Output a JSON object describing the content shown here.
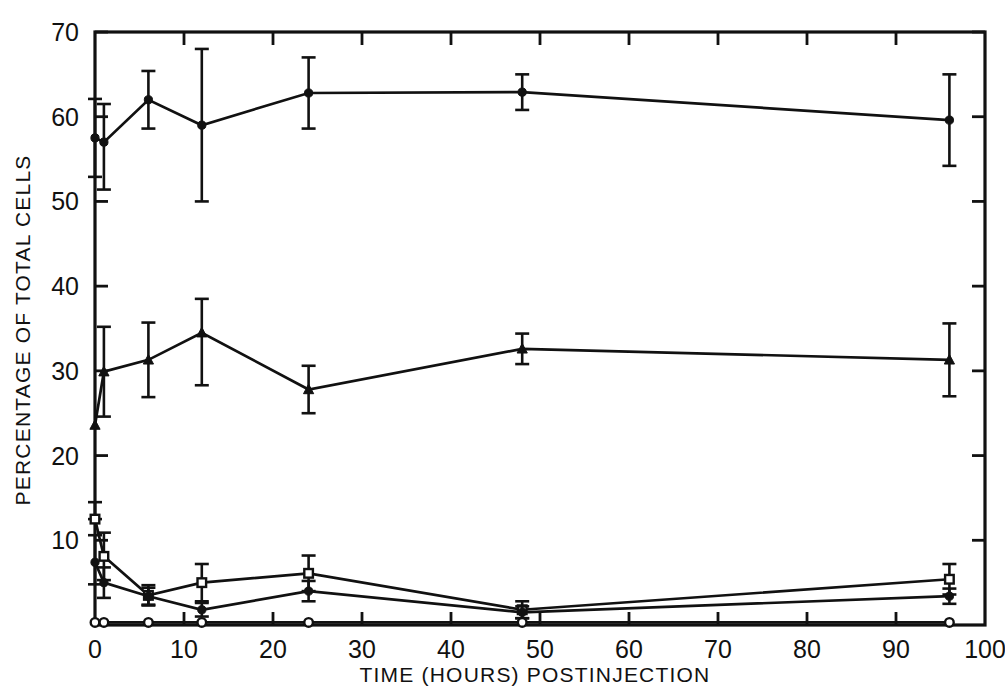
{
  "chart_data": {
    "type": "line",
    "title": "",
    "xlabel": "TIME (HOURS) POSTINJECTION",
    "ylabel": "PERCENTAGE OF TOTAL CELLS",
    "xlim": [
      0,
      100
    ],
    "ylim": [
      0,
      70
    ],
    "xticks": [
      0,
      10,
      20,
      30,
      40,
      50,
      60,
      70,
      80,
      90,
      100
    ],
    "xticklabels": [
      "0",
      "10",
      "20",
      "30",
      "40",
      "50",
      "60",
      "70",
      "80",
      "90",
      "100"
    ],
    "yticks": [
      0,
      10,
      20,
      30,
      40,
      50,
      60,
      70
    ],
    "yticklabels": [
      "",
      "10",
      "20",
      "30",
      "40",
      "50",
      "60",
      "70"
    ],
    "grid": false,
    "legend": "none",
    "error_bars": "vertical, capped (SD)",
    "axis_ticks": "inward on all four spines",
    "series": [
      {
        "name": "filled-circle-high",
        "marker": "filled-circle",
        "x": [
          0,
          1,
          6,
          12,
          24,
          48,
          96
        ],
        "values": [
          57.5,
          57.0,
          62.0,
          59.0,
          62.8,
          62.9,
          59.6
        ],
        "err_lo": [
          4.6,
          5.6,
          3.4,
          9.0,
          4.2,
          2.1,
          5.4
        ],
        "err_hi": [
          4.6,
          4.5,
          3.4,
          9.0,
          4.2,
          2.1,
          5.4
        ]
      },
      {
        "name": "filled-triangle-mid",
        "marker": "filled-triangle",
        "x": [
          0,
          1,
          6,
          12,
          24,
          48,
          96
        ],
        "values": [
          23.6,
          29.9,
          31.3,
          34.5,
          27.8,
          32.6,
          31.3
        ],
        "err_lo": [
          0.0,
          5.3,
          4.4,
          6.2,
          2.8,
          1.8,
          4.3
        ],
        "err_hi": [
          0.0,
          5.3,
          4.4,
          4.0,
          2.8,
          1.8,
          4.3
        ]
      },
      {
        "name": "open-square-low",
        "marker": "open-square",
        "x": [
          0,
          1,
          6,
          12,
          24,
          48,
          96
        ],
        "values": [
          12.5,
          8.1,
          3.5,
          5.0,
          6.1,
          1.8,
          5.4
        ],
        "err_lo": [
          0.0,
          2.8,
          1.2,
          2.2,
          2.1,
          1.0,
          1.8
        ],
        "err_hi": [
          2.0,
          2.8,
          1.2,
          2.2,
          2.1,
          1.0,
          1.8
        ]
      },
      {
        "name": "filled-circle-low",
        "marker": "filled-circle",
        "x": [
          0,
          1,
          6,
          12,
          24,
          48,
          96
        ],
        "values": [
          7.4,
          5.0,
          3.4,
          1.8,
          4.0,
          1.5,
          3.4
        ],
        "err_lo": [
          2.6,
          1.8,
          1.0,
          0.8,
          1.2,
          0.7,
          0.9
        ],
        "err_hi": [
          3.2,
          1.8,
          1.0,
          0.8,
          1.2,
          0.7,
          0.9
        ]
      },
      {
        "name": "open-circle-baseline",
        "marker": "open-circle",
        "x": [
          0,
          1,
          6,
          12,
          24,
          48,
          96
        ],
        "values": [
          0.3,
          0.3,
          0.3,
          0.3,
          0.3,
          0.3,
          0.3
        ],
        "err_lo": [
          0.0,
          0.0,
          0.0,
          0.0,
          0.0,
          0.0,
          0.0
        ],
        "err_hi": [
          0.0,
          0.0,
          0.0,
          0.0,
          0.0,
          0.0,
          0.0
        ]
      }
    ],
    "annotations": []
  }
}
